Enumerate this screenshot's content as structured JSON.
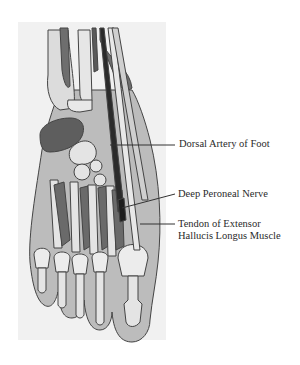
{
  "figure": {
    "labels": [
      {
        "id": "dorsal-artery",
        "text": "Dorsal Artery of Foot"
      },
      {
        "id": "deep-peroneal-nerve",
        "text": "Deep Peroneal Nerve"
      },
      {
        "id": "tendon-ehl",
        "lines": [
          "Tendon of Extensor",
          "Hallucis Longus Muscle"
        ]
      }
    ],
    "colors": {
      "background": "#ffffff",
      "panel": "#f1f1f1",
      "skin": "#bcbcbc",
      "muscle": "#6e6e6e",
      "bone": "#e2e2e2",
      "artery": "#2b2b2b",
      "outline": "#444444",
      "leader": "#333333"
    }
  }
}
